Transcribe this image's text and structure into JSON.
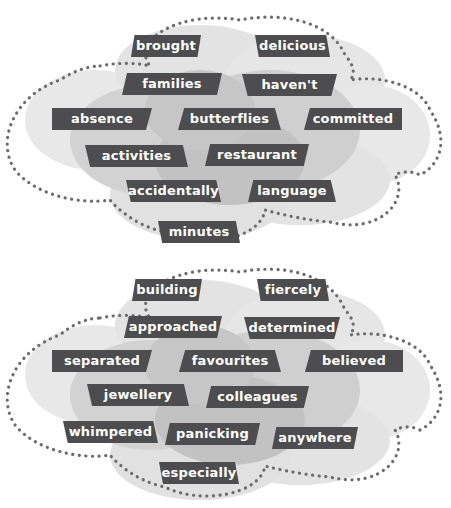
{
  "colors": {
    "label_bg": "#4d4d4f",
    "label_text": "#ffffff",
    "dots": "#6b6b6b",
    "cloud_light": "#e6e6e6",
    "cloud_mid": "#d0d0d0",
    "cloud_dark": "#bcbcbc"
  },
  "cloud1": {
    "words": [
      "brought",
      "delicious",
      "families",
      "haven't",
      "absence",
      "butterflies",
      "committed",
      "activities",
      "restaurant",
      "accidentally",
      "language",
      "minutes"
    ]
  },
  "cloud2": {
    "words": [
      "building",
      "fiercely",
      "approached",
      "determined",
      "separated",
      "favourites",
      "believed",
      "jewellery",
      "colleagues",
      "whimpered",
      "panicking",
      "anywhere",
      "especially"
    ]
  }
}
